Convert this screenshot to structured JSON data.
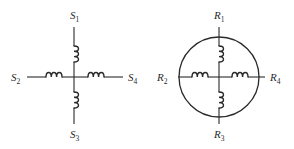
{
  "diagram": {
    "stator": {
      "name": "S",
      "terminals": [
        {
          "id": "S1",
          "letter": "S",
          "sub": "1",
          "position": "top"
        },
        {
          "id": "S2",
          "letter": "S",
          "sub": "2",
          "position": "left"
        },
        {
          "id": "S3",
          "letter": "S",
          "sub": "3",
          "position": "bottom"
        },
        {
          "id": "S4",
          "letter": "S",
          "sub": "4",
          "position": "right"
        }
      ],
      "coils": 4,
      "enclosed_in_circle": false
    },
    "rotor": {
      "name": "R",
      "terminals": [
        {
          "id": "R1",
          "letter": "R",
          "sub": "1",
          "position": "top"
        },
        {
          "id": "R2",
          "letter": "R",
          "sub": "2",
          "position": "left"
        },
        {
          "id": "R3",
          "letter": "R",
          "sub": "3",
          "position": "bottom"
        },
        {
          "id": "R4",
          "letter": "R",
          "sub": "4",
          "position": "right"
        }
      ],
      "coils": 4,
      "enclosed_in_circle": true
    },
    "colors": {
      "line": "#2a2a2a",
      "background": "#ffffff"
    }
  }
}
